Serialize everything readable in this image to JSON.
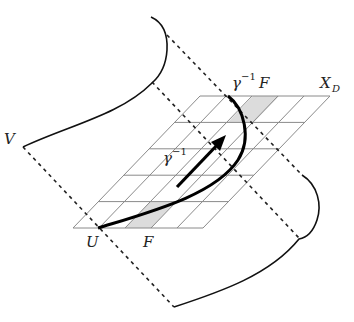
{
  "labels": {
    "V": "V",
    "U": "U",
    "F": "F",
    "gamma_inv_F_base": "γ",
    "gamma_inv_F_sup": "−1",
    "gamma_inv_F_tail": "F",
    "gamma_inv_base": "γ",
    "gamma_inv_sup": "−1",
    "X_D_base": "X",
    "X_D_sub": "D"
  },
  "grid": {
    "rows": 5,
    "cols": 5,
    "shaded_cells": [
      {
        "row": 0,
        "col": 2,
        "label": "F"
      },
      {
        "row": 4,
        "col": 2,
        "label": "γ⁻¹F"
      }
    ],
    "line_color": "#888888",
    "shade_color": "#dcdcdc"
  },
  "colors": {
    "curve": "#111111",
    "dashed": "#222222"
  }
}
